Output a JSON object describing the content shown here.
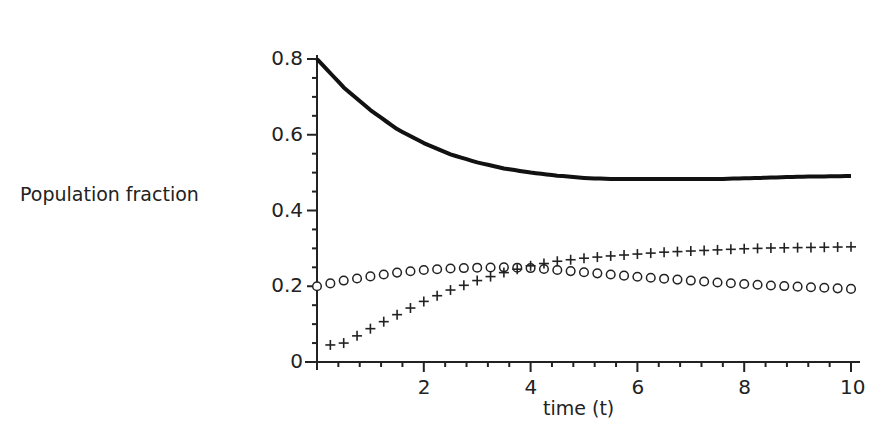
{
  "chart_data": {
    "type": "line",
    "title": "",
    "xlabel": "time (t)",
    "ylabel": "Population fraction",
    "xlim": [
      0,
      10
    ],
    "ylim": [
      0,
      0.8
    ],
    "grid": false,
    "legend": null,
    "x_ticks": [
      2,
      4,
      6,
      8,
      10
    ],
    "x_tick_labels": [
      "2",
      "4",
      "6",
      "8",
      "10"
    ],
    "y_ticks": [
      0,
      0.2,
      0.4,
      0.6,
      0.8
    ],
    "y_tick_labels": [
      "0",
      "0.2",
      "0.4",
      "0.6",
      "0.8"
    ],
    "x": [
      0,
      0.5,
      1,
      1.5,
      2,
      2.5,
      3,
      3.5,
      4,
      4.5,
      5,
      5.5,
      6,
      6.5,
      7,
      7.5,
      8,
      8.5,
      9,
      9.5,
      10
    ],
    "series": [
      {
        "name": "solid curve",
        "style": "solid-thick",
        "values": [
          0.8,
          0.725,
          0.665,
          0.615,
          0.578,
          0.548,
          0.527,
          0.511,
          0.5,
          0.492,
          0.486,
          0.483,
          0.483,
          0.483,
          0.483,
          0.483,
          0.485,
          0.487,
          0.489,
          0.49,
          0.491
        ]
      },
      {
        "name": "circles",
        "style": "circle-markers",
        "values": [
          0.2,
          0.215,
          0.226,
          0.236,
          0.243,
          0.247,
          0.249,
          0.25,
          0.248,
          0.243,
          0.237,
          0.231,
          0.225,
          0.22,
          0.215,
          0.21,
          0.206,
          0.202,
          0.199,
          0.196,
          0.193
        ]
      },
      {
        "name": "crosses",
        "style": "cross-markers",
        "values": [
          0.0,
          0.05,
          0.088,
          0.125,
          0.16,
          0.19,
          0.215,
          0.236,
          0.254,
          0.266,
          0.274,
          0.28,
          0.285,
          0.29,
          0.293,
          0.296,
          0.299,
          0.301,
          0.302,
          0.303,
          0.304
        ]
      }
    ]
  },
  "labels": {
    "ylabel": "Population fraction",
    "xlabel": "time (t)"
  }
}
